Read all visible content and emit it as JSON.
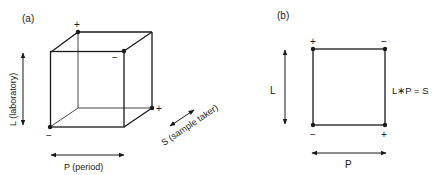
{
  "panel_a": {
    "label": "(a)",
    "axis_l": "L (laboratory)",
    "axis_p": "P (period)",
    "axis_s": "S (sample taker)",
    "vertex_signs": {
      "back_top_left": "+",
      "front_top_right": "−",
      "back_bottom_right": "+",
      "front_bottom_left": "−"
    }
  },
  "panel_b": {
    "label": "(b)",
    "axis_l": "L",
    "axis_p": "P",
    "equation": "L∗P = S",
    "vertex_signs": {
      "top_left": "+",
      "top_right": "−",
      "bottom_left": "−",
      "bottom_right": "+"
    }
  },
  "colors": {
    "line": "#1a1a1a",
    "background": "#ffffff"
  }
}
